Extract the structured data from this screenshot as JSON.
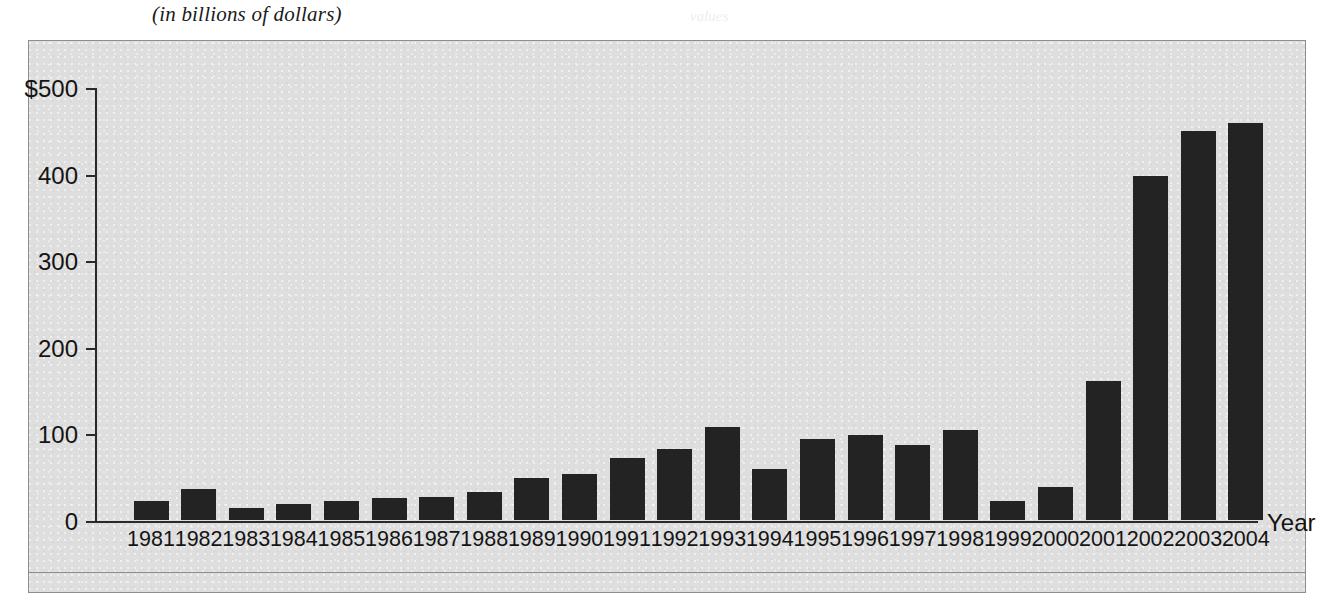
{
  "figure": {
    "subtitle": "(in billions of dollars)",
    "ghost_artifact": "values"
  },
  "chart_data": {
    "type": "bar",
    "title": "",
    "subtitle": "(in billions of dollars)",
    "xlabel": "Year",
    "ylabel": "",
    "categories": [
      "1981",
      "1982",
      "1983",
      "1984",
      "1985",
      "1986",
      "1987",
      "1988",
      "1989",
      "1990",
      "1991",
      "1992",
      "1993",
      "1994",
      "1995",
      "1996",
      "1997",
      "1998",
      "1999",
      "2000",
      "2001",
      "2002",
      "2003",
      "2004"
    ],
    "values": [
      22,
      36,
      14,
      18,
      22,
      25,
      26,
      32,
      48,
      53,
      72,
      82,
      107,
      59,
      93,
      98,
      87,
      104,
      22,
      38,
      160,
      397,
      449,
      458
    ],
    "ylim": [
      0,
      500
    ],
    "y_ticks": [
      0,
      100,
      200,
      300,
      400,
      500
    ],
    "y_tick_labels": [
      "0",
      "100",
      "200",
      "300",
      "400",
      "$500"
    ],
    "grid": false,
    "legend": null,
    "bar_color": "#232323",
    "panel_color": "#dedede"
  }
}
